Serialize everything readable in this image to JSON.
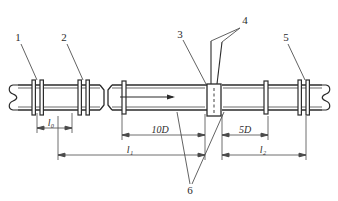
{
  "diagram": {
    "type": "engineering-line-diagram",
    "colors": {
      "line": "#2b2b2b",
      "dim_line": "#4a4a4a",
      "leader": "#5a5a5a",
      "text": "#2b2b2b",
      "background": "#ffffff",
      "meter_fill": "#ffffff"
    },
    "callouts": [
      {
        "id": "1",
        "label": "1",
        "text_x": 18,
        "text_y": 40,
        "leader_from_x": 21,
        "leader_from_y": 44,
        "leader_to_x": 37,
        "leader_to_y": 80
      },
      {
        "id": "2",
        "label": "2",
        "text_x": 64,
        "text_y": 40,
        "leader_from_x": 67,
        "leader_from_y": 44,
        "leader_to_x": 83,
        "leader_to_y": 80
      },
      {
        "id": "3",
        "label": "3",
        "text_x": 180,
        "text_y": 36,
        "leader_from_x": 183,
        "leader_from_y": 40,
        "leader_to_x": 205,
        "leader_to_y": 84
      },
      {
        "id": "4",
        "label": "4",
        "text_x": 243,
        "text_y": 22,
        "leader_a_from_x": 241,
        "leader_a_from_y": 27,
        "leader_a_to_x": 211,
        "leader_a_to_y": 41,
        "leader_b_from_x": 241,
        "leader_b_from_y": 27,
        "leader_b_to_x": 222,
        "leader_b_to_y": 42
      },
      {
        "id": "5",
        "label": "5",
        "text_x": 285,
        "text_y": 40,
        "leader_from_x": 288,
        "leader_from_y": 44,
        "leader_to_x": 305,
        "leader_to_y": 80
      },
      {
        "id": "6",
        "label": "6",
        "text_x": 189,
        "text_y": 192,
        "leader_a_from_x": 190,
        "leader_a_from_y": 184,
        "leader_a_to_x": 177,
        "leader_a_to_y": 112,
        "leader_b_from_x": 192,
        "leader_b_from_y": 184,
        "leader_b_to_x": 224,
        "leader_b_to_y": 112
      }
    ],
    "dimensions": [
      {
        "name": "l0",
        "label": "l",
        "subscript": "0",
        "value_text": "l₀",
        "x_start": 37,
        "x_end": 72,
        "y": 128,
        "label_x": 51,
        "label_y": 126
      },
      {
        "name": "10D",
        "label": "10D",
        "subscript": "",
        "value_text": "10D",
        "x_start": 122,
        "x_end": 205,
        "y": 135,
        "label_x": 152,
        "label_y": 133
      },
      {
        "name": "l1",
        "label": "l",
        "subscript": "1",
        "value_text": "l₁",
        "x_start": 58,
        "x_end": 205,
        "y": 155,
        "label_x": 126,
        "label_y": 153
      },
      {
        "name": "5D",
        "label": "5D",
        "subscript": "",
        "value_text": "5D",
        "x_start": 222,
        "x_end": 268,
        "y": 135,
        "label_x": 240,
        "label_y": 133
      },
      {
        "name": "l2",
        "label": "l",
        "subscript": "2",
        "value_text": "l₂",
        "x_start": 222,
        "x_end": 306,
        "y": 155,
        "label_x": 259,
        "label_y": 153
      }
    ],
    "flow_arrow": {
      "name": "flow-direction-arrow",
      "x_start": 120,
      "x_end": 175,
      "y": 97,
      "direction": "right"
    },
    "pipe": {
      "top_y": 85,
      "bottom_y": 110,
      "left_x": 10,
      "right_x": 330,
      "inner_top_y": 88,
      "inner_bottom_y": 107
    },
    "flange_groups": [
      {
        "name": "flange-pair-1",
        "x": 32,
        "count": 2,
        "spacing": 8
      },
      {
        "name": "flange-pair-2",
        "x": 78,
        "count": 2,
        "spacing": 8
      },
      {
        "name": "flange-single-3",
        "x": 124,
        "count": 1,
        "spacing": 0
      },
      {
        "name": "flange-single-4",
        "x": 265,
        "count": 1,
        "spacing": 0
      },
      {
        "name": "flange-pair-5",
        "x": 300,
        "count": 2,
        "spacing": 8
      }
    ],
    "meter_body": {
      "name": "flow-meter-body",
      "x": 207,
      "y": 84,
      "width": 14,
      "height": 32,
      "centerline": true
    },
    "pipe_joint": {
      "name": "pipe-coupling-joint",
      "x": 100,
      "width": 12
    },
    "break_symbols": [
      {
        "name": "pipe-break-left",
        "x": 13,
        "side": "left"
      },
      {
        "name": "pipe-break-right",
        "x": 322,
        "side": "right"
      }
    ]
  }
}
